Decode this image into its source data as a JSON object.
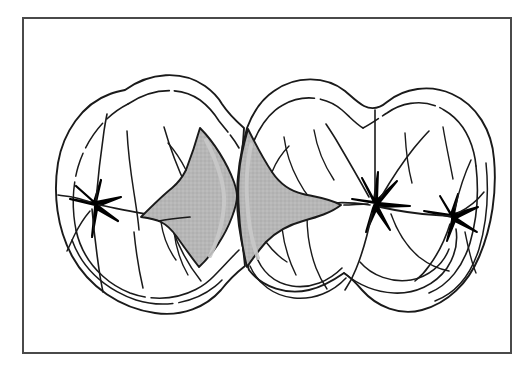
{
  "figure": {
    "title": "Occlusal view of two adjacent posterior teeth with shaded proximal contact surfaces",
    "caption": "",
    "background_color": "#ffffff",
    "border": {
      "color": "#4a4a4a",
      "width_px": 2,
      "x": 22,
      "y": 17,
      "width": 488,
      "height": 335
    },
    "line_color": "#1a1a1a",
    "shade_color": "#b5b5b5",
    "shade_highlight_color": "#c9c9c9",
    "fossa_color": "#000000",
    "tooth_fill": "#ffffff",
    "objects": [
      {
        "name": "left-tooth",
        "label": "Left posterior tooth (premolar), occlusal view",
        "type": "tooth-outline",
        "fossa_points": [
          [
            95,
            205
          ]
        ],
        "shaded_surface": "distal-proximal-contact-area"
      },
      {
        "name": "right-tooth",
        "label": "Right posterior tooth (molar), occlusal view",
        "type": "tooth-outline",
        "fossa_points": [
          [
            375,
            203
          ],
          [
            452,
            217
          ]
        ],
        "shaded_surface": "mesial-proximal-contact-area"
      },
      {
        "name": "left-shaded-proximal-surface",
        "label": "Shaded distal proximal surface of left tooth",
        "type": "shaded-region",
        "fill": "#b5b5b5"
      },
      {
        "name": "right-shaded-proximal-surface",
        "label": "Shaded mesial proximal surface of right tooth",
        "type": "shaded-region",
        "fill": "#b5b5b5"
      },
      {
        "name": "contact-point",
        "label": "Interproximal contact point between the two teeth",
        "type": "contact-point",
        "x": 237,
        "y": 196
      }
    ]
  }
}
